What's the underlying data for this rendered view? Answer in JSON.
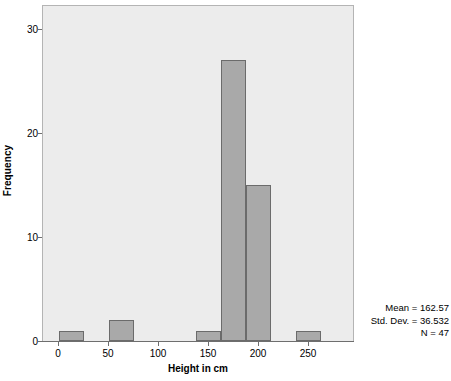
{
  "chart_data": {
    "type": "bar",
    "title": "",
    "subtitle": "",
    "xlabel": "Height in cm",
    "ylabel": "Frequency",
    "xlim": [
      -16,
      296
    ],
    "ylim": [
      0,
      32.3
    ],
    "grid": false,
    "legend": null,
    "bin_width": 25,
    "x_ticks": [
      {
        "value": 0,
        "label": "0"
      },
      {
        "value": 50,
        "label": "50"
      },
      {
        "value": 100,
        "label": "100"
      },
      {
        "value": 150,
        "label": "150"
      },
      {
        "value": 200,
        "label": "200"
      },
      {
        "value": 250,
        "label": "250"
      }
    ],
    "y_ticks": [
      {
        "value": 0,
        "label": "0"
      },
      {
        "value": 10,
        "label": "10"
      },
      {
        "value": 20,
        "label": "20"
      },
      {
        "value": 30,
        "label": "30"
      }
    ],
    "bins": [
      {
        "x_start": 0,
        "x_end": 25,
        "value": 1
      },
      {
        "x_start": 50,
        "x_end": 75,
        "value": 2
      },
      {
        "x_start": 137,
        "x_end": 162,
        "value": 1
      },
      {
        "x_start": 162,
        "x_end": 187,
        "value": 27
      },
      {
        "x_start": 187,
        "x_end": 212,
        "value": 15
      },
      {
        "x_start": 237,
        "x_end": 262,
        "value": 1
      }
    ],
    "categories": [
      "0-25",
      "50-75",
      "137-162",
      "162-187",
      "187-212",
      "237-262"
    ],
    "values": [
      1,
      2,
      1,
      27,
      15,
      1
    ],
    "annotations": {
      "mean_label": "Mean = 162.57",
      "std_dev_label": "Std. Dev. = 36.532",
      "n_label": "N = 47"
    },
    "colors": {
      "bar_fill": "#a9a9a9",
      "bar_border": "#6b6b6b",
      "plot_background": "#ececec",
      "plot_border": "#b4b4b4",
      "axis": "#6e6e6e",
      "text": "#000000"
    }
  }
}
